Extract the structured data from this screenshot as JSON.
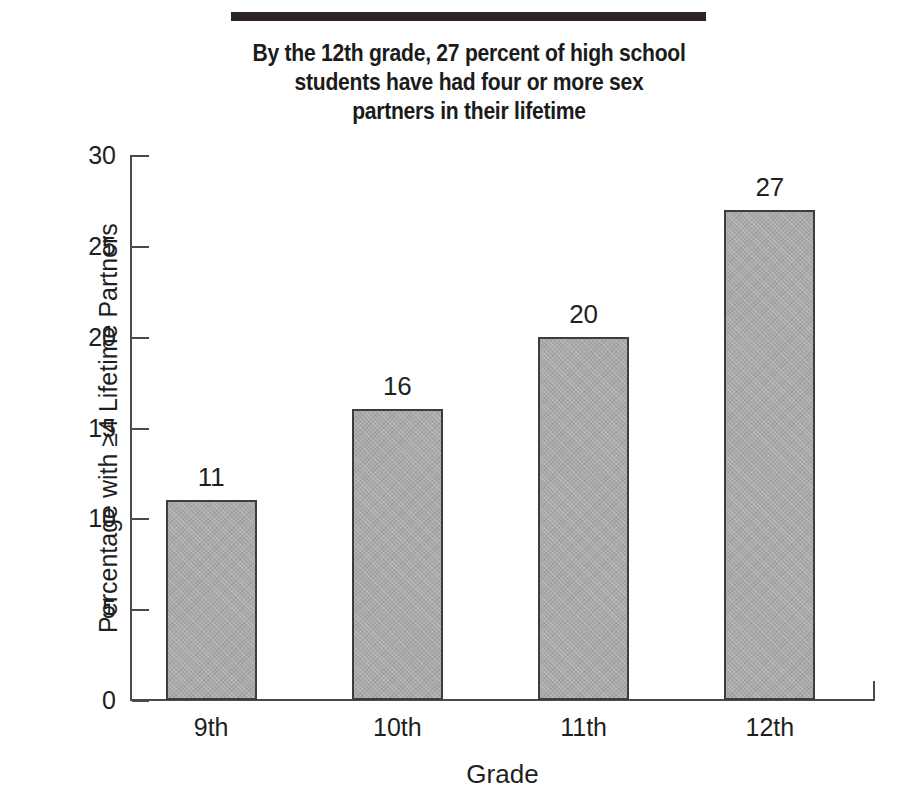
{
  "figure": {
    "top_rule": "decorative-rule"
  },
  "title": {
    "lines": [
      "By the 12th grade, 27 percent of high school",
      "students have had four or more sex",
      "partners in their lifetime"
    ]
  },
  "chart_data": {
    "type": "bar",
    "title": "By the 12th grade, 27 percent of high school students have had four or more sex partners in their lifetime",
    "categories": [
      "9th",
      "10th",
      "11th",
      "12th"
    ],
    "values": [
      11,
      16,
      20,
      27
    ],
    "data_labels": [
      "11",
      "16",
      "20",
      "27"
    ],
    "xlabel": "Grade",
    "ylabel": "Percentage with ≥4 Lifetime Partners",
    "ylim": [
      0,
      30
    ],
    "yticks": [
      0,
      5,
      10,
      15,
      20,
      25,
      30
    ],
    "ytick_labels": [
      "0",
      "5",
      "10",
      "15",
      "20",
      "25",
      "30"
    ],
    "grid": false,
    "legend": null,
    "bar_color": "#a9a9a9",
    "bar_edge_color": "#3d3d3d",
    "axis_color": "#4a4a4a",
    "text_color": "#1f1f1f",
    "rule_color": "#2b2421"
  }
}
